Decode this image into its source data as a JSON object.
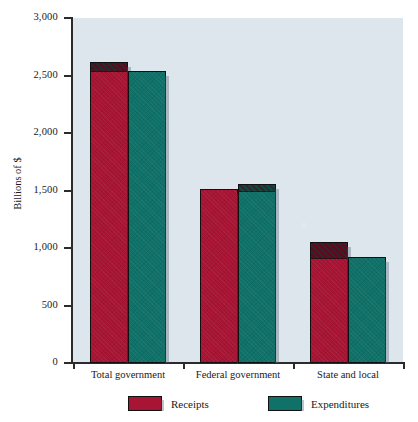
{
  "chart_data": {
    "type": "bar",
    "title": "",
    "xlabel": "",
    "ylabel": "Billions of $",
    "ylim": [
      0,
      3000
    ],
    "yticks": [
      0,
      500,
      1000,
      1500,
      2000,
      2500,
      3000
    ],
    "ytick_labels": [
      "0",
      "500",
      "1,000",
      "1,500",
      "2,000",
      "2,500",
      "3,000"
    ],
    "grid": false,
    "legend_position": "bottom",
    "categories": [
      "Total government",
      "Federal government",
      "State and local"
    ],
    "series": [
      {
        "name": "Receipts",
        "color": "#a81434",
        "values": [
          2620,
          1510,
          1055
        ]
      },
      {
        "name": "Expenditures",
        "color": "#0f7168",
        "values": [
          2540,
          1560,
          920
        ]
      }
    ],
    "highlight_note": "Hatched cap marks the taller bar of each pair (the surplus/deficit gap)",
    "hatch_caps": [
      {
        "category": "Total government",
        "series": "Receipts",
        "from": 2545,
        "to": 2620
      },
      {
        "category": "Federal government",
        "series": "Expenditures",
        "from": 1505,
        "to": 1560
      },
      {
        "category": "State and local",
        "series": "Receipts",
        "from": 925,
        "to": 1055
      }
    ]
  },
  "axis": {
    "y_title": "Billions of $"
  },
  "legend": {
    "items": [
      {
        "label": "Receipts",
        "color": "#a81434",
        "swatch": "receipts-swatch"
      },
      {
        "label": "Expenditures",
        "color": "#0f7168",
        "swatch": "expenditures-swatch"
      }
    ]
  },
  "colors": {
    "plot_background": "#dde5ed",
    "page_background": "#ffffff",
    "axis": "#2b2b2b",
    "receipts": "#a81434",
    "expenditures": "#0f7168",
    "hatch": "#2a2a2a"
  }
}
